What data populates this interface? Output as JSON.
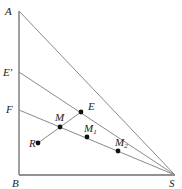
{
  "diagram": {
    "title": "",
    "points": {
      "A": {
        "label": "A"
      },
      "E_prime": {
        "label": "E'"
      },
      "F": {
        "label": "F"
      },
      "B": {
        "label": "B"
      },
      "S": {
        "label": "S"
      },
      "E": {
        "label": "E"
      },
      "M": {
        "label": "M"
      },
      "R": {
        "label": "R"
      },
      "M1": {
        "label": "M",
        "sub": "1"
      },
      "M2": {
        "label": "M",
        "sub": "2"
      }
    },
    "segments": [
      [
        "A",
        "B"
      ],
      [
        "B",
        "S"
      ],
      [
        "A",
        "S"
      ],
      [
        "E_prime",
        "S"
      ],
      [
        "F",
        "S"
      ],
      [
        "R",
        "E"
      ]
    ],
    "marked_points": [
      "E",
      "M",
      "R",
      "M1",
      "M2"
    ]
  }
}
